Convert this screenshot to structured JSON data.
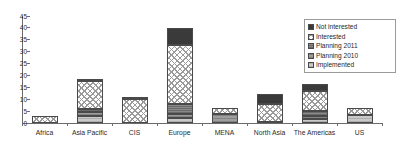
{
  "title_strip": {
    "text": " "
  },
  "legend": {
    "position": "top-right",
    "items": [
      {
        "label": "Not interested",
        "key": "not_interested",
        "color": "#3a3a3a"
      },
      {
        "label": "Interested",
        "key": "interested",
        "color": "#ffffff"
      },
      {
        "label": "Planning 2011",
        "key": "planning_2011",
        "color": "#8a8a8a"
      },
      {
        "label": "Planning 2010",
        "key": "planning_2010",
        "color": "#9e9e9e"
      },
      {
        "label": "Implemented",
        "key": "implemented",
        "color": "#c9c9c9"
      }
    ]
  },
  "chart_data": {
    "type": "bar",
    "stacked": true,
    "title": "",
    "xlabel": "",
    "ylabel": "",
    "ylim": [
      0,
      45
    ],
    "yticks": [
      0,
      5,
      10,
      15,
      20,
      25,
      30,
      35,
      40,
      45
    ],
    "grid": false,
    "legend_position": "top-right",
    "categories": [
      "Africa",
      "Asia Pacific",
      "CIS",
      "Europe",
      "MENA",
      "North Asia",
      "The Americas",
      "US"
    ],
    "series": [
      {
        "name": "Implemented",
        "color": "#c9c9c9",
        "values": [
          0,
          3,
          0,
          2,
          0,
          0,
          1.5,
          3.5
        ]
      },
      {
        "name": "Planning 2010",
        "color": "#9e9e9e",
        "values": [
          0,
          1.5,
          0,
          2,
          4,
          0.5,
          1.5,
          0
        ]
      },
      {
        "name": "Planning 2011",
        "color": "#8a8a8a",
        "values": [
          0,
          1.5,
          0,
          4,
          0,
          0,
          2,
          0
        ]
      },
      {
        "name": "Interested",
        "color": "#ffffff",
        "values": [
          3,
          11.5,
          10,
          25,
          2.5,
          7.5,
          8.5,
          3
        ]
      },
      {
        "name": "Not interested",
        "color": "#3a3a3a",
        "values": [
          0,
          0.5,
          1,
          7,
          0,
          4,
          3,
          0
        ]
      }
    ],
    "totals": [
      3,
      18,
      11,
      40,
      6.5,
      12,
      16.5,
      6.5
    ]
  }
}
